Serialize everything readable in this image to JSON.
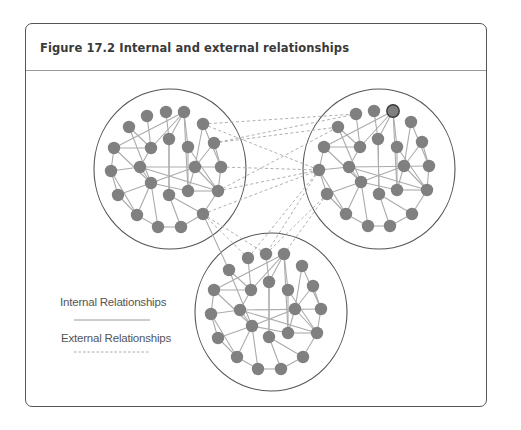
{
  "figure": {
    "number": "Figure 17.2",
    "title": "Internal and external relationships"
  },
  "legend": {
    "items": [
      {
        "label": "Internal Relationships",
        "style": "solid"
      },
      {
        "label": "External Relationships",
        "style": "dashed"
      }
    ]
  },
  "colors": {
    "frame_border": "#555555",
    "header_rule": "#9a9a9a",
    "node_fill": "#808080",
    "node_highlight_stroke": "#3a3a3a",
    "internal_edge": "#ababab",
    "external_edge": "#b0b0b0",
    "cluster_outline": "#555555"
  },
  "clusters": [
    {
      "name": "left-cluster",
      "circle": {
        "cx": 170,
        "cy": 169,
        "rx": 76,
        "ry": 80
      },
      "nodes": [
        [
          147,
          116
        ],
        [
          166,
          112
        ],
        [
          184,
          112
        ],
        [
          129,
          127
        ],
        [
          203,
          124
        ],
        [
          169,
          139
        ],
        [
          114,
          148
        ],
        [
          151,
          148
        ],
        [
          188,
          147
        ],
        [
          214,
          143
        ],
        [
          111,
          171
        ],
        [
          140,
          167
        ],
        [
          195,
          167
        ],
        [
          221,
          167
        ],
        [
          151,
          183
        ],
        [
          188,
          191
        ],
        [
          169,
          195
        ],
        [
          218,
          191
        ],
        [
          118,
          195
        ],
        [
          137,
          215
        ],
        [
          203,
          214
        ],
        [
          158,
          227
        ],
        [
          181,
          227
        ]
      ],
      "highlight": -1
    },
    {
      "name": "right-cluster",
      "circle": {
        "cx": 379,
        "cy": 169,
        "rx": 76,
        "ry": 80
      },
      "nodes": [
        [
          356,
          114
        ],
        [
          374,
          111
        ],
        [
          393,
          111
        ],
        [
          338,
          127
        ],
        [
          411,
          122
        ],
        [
          378,
          139
        ],
        [
          324,
          147
        ],
        [
          360,
          147
        ],
        [
          397,
          147
        ],
        [
          422,
          142
        ],
        [
          319,
          170
        ],
        [
          349,
          167
        ],
        [
          404,
          166
        ],
        [
          429,
          166
        ],
        [
          361,
          182
        ],
        [
          397,
          190
        ],
        [
          379,
          194
        ],
        [
          427,
          190
        ],
        [
          327,
          194
        ],
        [
          346,
          214
        ],
        [
          412,
          214
        ],
        [
          368,
          226
        ],
        [
          390,
          226
        ]
      ],
      "highlight": 2
    },
    {
      "name": "bottom-cluster",
      "circle": {
        "cx": 271,
        "cy": 312,
        "rx": 76,
        "ry": 79
      },
      "nodes": [
        [
          248,
          258
        ],
        [
          266,
          254
        ],
        [
          284,
          254
        ],
        [
          229,
          270
        ],
        [
          302,
          266
        ],
        [
          269,
          282
        ],
        [
          214,
          290
        ],
        [
          251,
          290
        ],
        [
          288,
          290
        ],
        [
          313,
          286
        ],
        [
          211,
          314
        ],
        [
          240,
          310
        ],
        [
          295,
          309
        ],
        [
          321,
          309
        ],
        [
          252,
          326
        ],
        [
          288,
          333
        ],
        [
          269,
          337
        ],
        [
          317,
          333
        ],
        [
          218,
          338
        ],
        [
          237,
          357
        ],
        [
          303,
          357
        ],
        [
          258,
          369
        ],
        [
          281,
          369
        ]
      ],
      "highlight": -1
    }
  ],
  "internal_edges": [
    [
      2,
      6
    ],
    [
      2,
      7
    ],
    [
      2,
      5
    ],
    [
      2,
      8
    ],
    [
      2,
      15
    ],
    [
      0,
      7
    ],
    [
      1,
      5
    ],
    [
      3,
      7
    ],
    [
      3,
      14
    ],
    [
      6,
      7
    ],
    [
      6,
      10
    ],
    [
      6,
      14
    ],
    [
      4,
      13
    ],
    [
      4,
      12
    ],
    [
      9,
      12
    ],
    [
      9,
      13
    ],
    [
      5,
      16
    ],
    [
      7,
      11
    ],
    [
      8,
      17
    ],
    [
      10,
      11
    ],
    [
      10,
      18
    ],
    [
      10,
      19
    ],
    [
      11,
      14
    ],
    [
      11,
      13
    ],
    [
      11,
      17
    ],
    [
      14,
      18
    ],
    [
      14,
      19
    ],
    [
      14,
      21
    ],
    [
      14,
      15
    ],
    [
      14,
      12
    ],
    [
      18,
      19
    ],
    [
      19,
      21
    ],
    [
      21,
      22
    ],
    [
      22,
      20
    ],
    [
      20,
      17
    ],
    [
      20,
      16
    ],
    [
      16,
      22
    ],
    [
      15,
      17
    ],
    [
      12,
      17
    ],
    [
      12,
      15
    ],
    [
      13,
      17
    ],
    [
      8,
      15
    ],
    [
      5,
      16
    ]
  ],
  "cross_solid_edges": [
    [
      [
        203,
        214
      ],
      [
        229,
        270
      ]
    ]
  ],
  "external_edges": [
    [
      [
        203,
        124
      ],
      [
        356,
        114
      ]
    ],
    [
      [
        214,
        143
      ],
      [
        338,
        127
      ]
    ],
    [
      [
        203,
        124
      ],
      [
        319,
        170
      ]
    ],
    [
      [
        221,
        167
      ],
      [
        319,
        170
      ]
    ],
    [
      [
        218,
        191
      ],
      [
        338,
        127
      ]
    ],
    [
      [
        218,
        191
      ],
      [
        319,
        170
      ]
    ],
    [
      [
        203,
        214
      ],
      [
        319,
        170
      ]
    ],
    [
      [
        203,
        214
      ],
      [
        248,
        258
      ]
    ],
    [
      [
        203,
        214
      ],
      [
        266,
        254
      ]
    ],
    [
      [
        214,
        143
      ],
      [
        356,
        114
      ]
    ],
    [
      [
        319,
        170
      ],
      [
        248,
        258
      ]
    ],
    [
      [
        319,
        170
      ],
      [
        266,
        254
      ]
    ],
    [
      [
        327,
        194
      ],
      [
        266,
        254
      ]
    ],
    [
      [
        327,
        194
      ],
      [
        284,
        254
      ]
    ]
  ],
  "legend_lines": {
    "solid": {
      "x1": 74,
      "x2": 150,
      "y": 320
    },
    "dashed": {
      "x1": 74,
      "x2": 150,
      "y": 352
    }
  }
}
